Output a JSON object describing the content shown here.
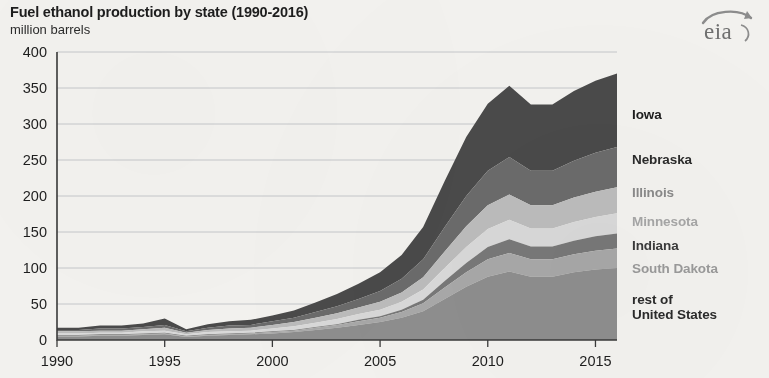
{
  "header": {
    "title": "Fuel ethanol production by state (1990-2016)",
    "subtitle": "million barrels",
    "logo_text": "eia",
    "logo_name": "eia-logo"
  },
  "chart_data": {
    "type": "area",
    "stacked": true,
    "title": "Fuel ethanol production by state (1990-2016)",
    "subtitle": "million barrels",
    "xlabel": "",
    "ylabel": "million barrels",
    "xlim": [
      1990,
      2016
    ],
    "ylim": [
      0,
      400
    ],
    "ytick_interval": 50,
    "grid": true,
    "legend_position": "right",
    "x": [
      1990,
      1991,
      1992,
      1993,
      1994,
      1995,
      1996,
      1997,
      1998,
      1999,
      2000,
      2001,
      2002,
      2003,
      2004,
      2005,
      2006,
      2007,
      2008,
      2009,
      2010,
      2011,
      2012,
      2013,
      2014,
      2015,
      2016
    ],
    "ytick_labels": [
      "0",
      "50",
      "100",
      "150",
      "200",
      "250",
      "300",
      "350",
      "400"
    ],
    "xtick_labels": [
      "1990",
      "1995",
      "2000",
      "2005",
      "2010",
      "2015"
    ],
    "xticks": [
      1990,
      1995,
      2000,
      2005,
      2010,
      2015
    ],
    "series": [
      {
        "name": "rest of United States",
        "color": "#8e8e8e",
        "values": [
          5,
          5,
          6,
          6,
          7,
          8,
          4,
          6,
          7,
          8,
          9,
          11,
          14,
          17,
          21,
          25,
          31,
          40,
          57,
          74,
          88,
          95,
          88,
          88,
          94,
          98,
          100
        ]
      },
      {
        "name": "South Dakota",
        "color": "#a8a8a8",
        "values": [
          1,
          1,
          1,
          1,
          1,
          1,
          1,
          1,
          1,
          1,
          2,
          2,
          3,
          4,
          5,
          6,
          8,
          11,
          16,
          20,
          24,
          26,
          24,
          24,
          25,
          26,
          27
        ]
      },
      {
        "name": "Indiana",
        "color": "#787878",
        "values": [
          1,
          1,
          1,
          1,
          1,
          1,
          1,
          1,
          1,
          1,
          1,
          1,
          1,
          1,
          2,
          2,
          3,
          5,
          9,
          13,
          17,
          19,
          18,
          18,
          19,
          20,
          21
        ]
      },
      {
        "name": "Minnesota",
        "color": "#d9d9d9",
        "values": [
          2,
          2,
          2,
          2,
          3,
          3,
          2,
          3,
          3,
          3,
          4,
          5,
          6,
          7,
          8,
          9,
          11,
          14,
          18,
          22,
          25,
          27,
          25,
          25,
          26,
          27,
          28
        ]
      },
      {
        "name": "Illinois",
        "color": "#bcbcbc",
        "values": [
          3,
          3,
          3,
          3,
          3,
          4,
          2,
          3,
          4,
          4,
          5,
          6,
          7,
          8,
          9,
          11,
          13,
          17,
          23,
          29,
          33,
          35,
          32,
          32,
          34,
          35,
          36
        ]
      },
      {
        "name": "Nebraska",
        "color": "#6b6b6b",
        "values": [
          2,
          2,
          3,
          3,
          3,
          4,
          2,
          3,
          4,
          4,
          5,
          6,
          8,
          10,
          12,
          15,
          19,
          25,
          34,
          42,
          48,
          52,
          48,
          48,
          51,
          54,
          56
        ]
      },
      {
        "name": "Iowa",
        "color": "#4a4a4a",
        "values": [
          3,
          3,
          4,
          4,
          5,
          9,
          3,
          5,
          6,
          7,
          8,
          10,
          13,
          17,
          21,
          26,
          33,
          45,
          64,
          82,
          93,
          99,
          92,
          92,
          97,
          100,
          102
        ]
      }
    ],
    "totals": [
      17,
      17,
      20,
      20,
      23,
      30,
      15,
      22,
      26,
      28,
      34,
      41,
      52,
      64,
      78,
      94,
      118,
      157,
      221,
      282,
      328,
      353,
      327,
      327,
      346,
      360,
      370
    ],
    "legend": [
      {
        "label": "Iowa",
        "color": "#4a4a4a",
        "text_color": "#1d1d1d"
      },
      {
        "label": "Nebraska",
        "color": "#6b6b6b",
        "text_color": "#2b2b2b"
      },
      {
        "label": "Illinois",
        "color": "#bcbcbc",
        "text_color": "#8a8a8a"
      },
      {
        "label": "Minnesota",
        "color": "#d9d9d9",
        "text_color": "#a6a6a6"
      },
      {
        "label": "Indiana",
        "color": "#787878",
        "text_color": "#3a3a3a"
      },
      {
        "label": "South Dakota",
        "color": "#a8a8a8",
        "text_color": "#9a9a9a"
      },
      {
        "label": "rest of United States",
        "color": "#8e8e8e",
        "text_color": "#2b2b2b"
      }
    ],
    "legend_lines": [
      {
        "line1": "Iowa",
        "line2": "",
        "top": 107
      },
      {
        "line1": "Nebraska",
        "line2": "",
        "top": 152
      },
      {
        "line1": "Illinois",
        "line2": "",
        "top": 185
      },
      {
        "line1": "Minnesota",
        "line2": "",
        "top": 214
      },
      {
        "line1": "Indiana",
        "line2": "",
        "top": 238
      },
      {
        "line1": "South Dakota",
        "line2": "",
        "top": 261
      },
      {
        "line1": "rest of",
        "line2": "United States",
        "top": 292
      }
    ]
  }
}
